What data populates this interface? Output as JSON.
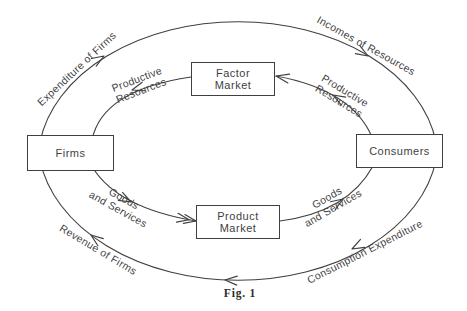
{
  "diagram": {
    "caption": "Fig. 1",
    "boxes": {
      "firms": {
        "label": "Firms"
      },
      "consumers": {
        "label": "Consumers"
      },
      "factor_market": {
        "line1": "Factor",
        "line2": "Market"
      },
      "product_market": {
        "line1": "Product",
        "line2": "Market"
      }
    },
    "flow_labels": {
      "expenditure_of_firms": "Expenditure of Firms",
      "incomes_of_resources": "Incomes of Resources",
      "productive_resources_top_left": {
        "line1": "Productive",
        "line2": "Resources"
      },
      "productive_resources_top_right": {
        "line1": "Productive",
        "line2": "Resources"
      },
      "goods_and_services_bottom_left": {
        "line1": "Goods",
        "line2": "and Services"
      },
      "goods_and_services_bottom_right": {
        "line1": "Goods",
        "line2": "and Services"
      },
      "revenue_of_firms": "Revenue of Firms",
      "consumption_expenditure": "Consumption Expenditure"
    },
    "colors": {
      "ink": "#3f3f3f",
      "background": "#ffffff"
    }
  }
}
